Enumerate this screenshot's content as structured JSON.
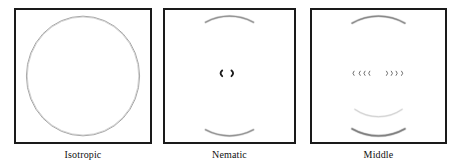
{
  "figure": {
    "type": "diffraction-pattern-series",
    "width": 456,
    "height": 168,
    "background_color": "#ffffff",
    "frame_color": "#1a1a1a",
    "pattern_color": "#8c8c8c",
    "pattern_color_dark": "#1c1c1c",
    "pattern_color_faint": "#c4c4c4"
  },
  "panels": [
    {
      "id": "isotropic",
      "label": "Isotropic",
      "x": 14,
      "y": 8,
      "width": 138,
      "height": 136,
      "description": "Full uniform diffraction ring",
      "features": {
        "ring": {
          "present": true,
          "center_x": 50,
          "center_y": 50,
          "radius_x": 41,
          "radius_y": 44,
          "stroke": 1.0,
          "color": "#9a9a9a"
        },
        "top_arc": {
          "present": false
        },
        "bottom_arc": {
          "present": false
        },
        "middle_arc": {
          "present": false
        },
        "center_marks": {
          "present": false,
          "count": 0
        }
      }
    },
    {
      "id": "nematic",
      "label": "Nematic",
      "x": 163,
      "y": 8,
      "width": 133,
      "height": 136,
      "description": "Two polar arcs plus two small equatorial crescents",
      "features": {
        "ring": {
          "present": false
        },
        "top_arc": {
          "present": true,
          "center_x": 50,
          "center_y": 50,
          "radius_x": 41,
          "radius_y": 44,
          "span_degrees": 52,
          "color": "#909090",
          "stroke": 1.3
        },
        "bottom_arc": {
          "present": true,
          "center_x": 50,
          "center_y": 50,
          "radius_x": 41,
          "radius_y": 44,
          "span_degrees": 52,
          "color": "#909090",
          "stroke": 1.3
        },
        "middle_arc": {
          "present": false
        },
        "center_marks": {
          "present": true,
          "count": 2,
          "positions_x": [
            43,
            53
          ],
          "position_y": 48,
          "color": "#1c1c1c",
          "size": "large"
        }
      }
    },
    {
      "id": "middle",
      "label": "Middle",
      "x": 310,
      "y": 8,
      "width": 137,
      "height": 136,
      "description": "Polar arcs, faint lower arc and a row of eight small equatorial crescents",
      "features": {
        "ring": {
          "present": false
        },
        "top_arc": {
          "present": true,
          "center_x": 50,
          "center_y": 50,
          "radius_x": 41,
          "radius_y": 44,
          "span_degrees": 56,
          "color": "#868686",
          "stroke": 1.3
        },
        "bottom_arc": {
          "present": true,
          "center_x": 50,
          "center_y": 50,
          "radius_x": 41,
          "radius_y": 44,
          "span_degrees": 56,
          "color": "#7c7c7c",
          "stroke": 1.5
        },
        "middle_arc": {
          "present": true,
          "center_x": 50,
          "center_y": 50,
          "radius_x": 30,
          "radius_y": 30,
          "span_degrees": 70,
          "color": "#d2d2d2",
          "stroke": 1.1
        },
        "center_marks": {
          "present": true,
          "count": 8,
          "left_positions_x": [
            31,
            35.5,
            39,
            42.5
          ],
          "right_positions_x": [
            57,
            60.5,
            64,
            68
          ],
          "position_y": 48,
          "color": "#6e6e6e",
          "size": "small"
        }
      }
    }
  ],
  "labels": {
    "panel_1": "Isotropic",
    "panel_2": "Nematic",
    "panel_3": "Middle"
  }
}
